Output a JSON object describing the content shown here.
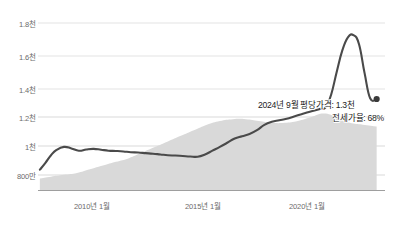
{
  "chart_data": {
    "type": "line",
    "title": "",
    "xlabel": "",
    "ylabel": "",
    "grid": true,
    "legend": "none",
    "ylim": [
      800,
      1800
    ],
    "yticks": [
      {
        "value": 1800,
        "label": "1.8천"
      },
      {
        "value": 1600,
        "label": "1.6천"
      },
      {
        "value": 1400,
        "label": "1.4천"
      },
      {
        "value": 1200,
        "label": "1.2천"
      },
      {
        "value": 1000,
        "label": "1천"
      },
      {
        "value": 800,
        "label": "800만"
      }
    ],
    "xticks": [
      {
        "value": 2010.0,
        "label": "2010년 1월"
      },
      {
        "value": 2015.0,
        "label": "2015년 1월"
      },
      {
        "value": 2020.0,
        "label": "2020년 1월"
      }
    ],
    "xlim": [
      2006.5,
      2025.2
    ],
    "series": [
      {
        "name": "평당가격",
        "type": "line",
        "color": "#4a4a4a",
        "x": [
          2006.6,
          2006.9,
          2007.2,
          2007.5,
          2007.9,
          2008.3,
          2008.7,
          2009.1,
          2009.5,
          2009.9,
          2010.3,
          2010.7,
          2011.1,
          2011.5,
          2011.9,
          2012.3,
          2012.7,
          2013.1,
          2013.5,
          2013.9,
          2014.3,
          2014.7,
          2015.1,
          2015.5,
          2015.9,
          2016.3,
          2016.7,
          2017.1,
          2017.5,
          2017.9,
          2018.3,
          2018.7,
          2019.1,
          2019.5,
          2019.9,
          2020.3,
          2020.7,
          2021.1,
          2021.4,
          2021.7,
          2022.0,
          2022.3,
          2022.6,
          2022.9,
          2023.2,
          2023.5,
          2023.8,
          2024.1,
          2024.4,
          2024.75
        ],
        "y": [
          835,
          880,
          930,
          965,
          985,
          975,
          960,
          968,
          972,
          966,
          960,
          958,
          955,
          950,
          948,
          944,
          940,
          935,
          930,
          928,
          925,
          922,
          920,
          935,
          960,
          985,
          1012,
          1040,
          1055,
          1070,
          1095,
          1130,
          1150,
          1160,
          1170,
          1185,
          1200,
          1215,
          1225,
          1235,
          1245,
          1330,
          1480,
          1620,
          1705,
          1720,
          1660,
          1470,
          1305,
          1300
        ],
        "end_marker": {
          "x": 2024.75,
          "y": 1300,
          "color": "#3a3a3a"
        }
      },
      {
        "name": "전세가율",
        "type": "area",
        "color": "#d9d9d9",
        "x": [
          2006.6,
          2007.2,
          2007.9,
          2008.6,
          2009.3,
          2010.0,
          2010.7,
          2011.4,
          2012.1,
          2012.8,
          2013.5,
          2014.2,
          2014.9,
          2015.6,
          2016.3,
          2017.0,
          2017.7,
          2018.4,
          2019.1,
          2019.8,
          2020.5,
          2021.2,
          2021.9,
          2022.6,
          2023.3,
          2024.0,
          2024.75
        ],
        "y_percent": [
          40,
          41,
          42,
          43,
          45,
          47,
          49,
          51,
          54,
          57,
          60,
          63,
          66,
          69,
          71,
          72,
          72,
          71,
          70,
          70,
          71,
          73,
          75,
          73,
          70,
          69,
          68
        ]
      }
    ],
    "annotations": [
      {
        "name": "price-annotation",
        "text": "2024년 9월 평당가격: 1.3천"
      },
      {
        "name": "jeonse-ratio-annotation",
        "text": "전세가율: 68%"
      }
    ],
    "colors": {
      "line": "#4a4a4a",
      "area": "#d9d9d9",
      "grid": "#d6d6d6",
      "axis": "#b0b0b0",
      "tick_text": "#6b6b6b",
      "annotation_text": "#1c1c1c"
    }
  }
}
